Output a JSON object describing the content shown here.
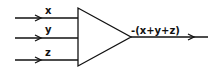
{
  "diagram": {
    "inputs": [
      {
        "label": "x"
      },
      {
        "label": "y"
      },
      {
        "label": "z"
      }
    ],
    "block": {
      "shape": "triangle",
      "role": "amplifier"
    },
    "output": {
      "label": "-(x+y+z)"
    },
    "colors": {
      "stroke": "#111111",
      "background": "#ffffff"
    }
  }
}
